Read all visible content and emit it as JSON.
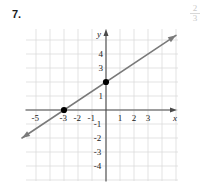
{
  "problem": {
    "number_label": "7."
  },
  "margin_note": {
    "numerator": "2",
    "denominator": "3"
  },
  "chart_data": {
    "type": "line",
    "title": "",
    "xlabel": "x",
    "ylabel": "y",
    "xlim": [
      -5.5,
      5.5
    ],
    "ylim": [
      -5.5,
      5.5
    ],
    "grid": true,
    "grid_step": 1,
    "legend": "none",
    "x_tick_labels": [
      "-5",
      "-3",
      "-2",
      "-1",
      "1",
      "2",
      "3"
    ],
    "x_tick_values": [
      -5,
      -3,
      -2,
      -1,
      1,
      2,
      3
    ],
    "y_tick_labels": [
      "4",
      "3",
      "1",
      "-1",
      "-2",
      "-3",
      "-4"
    ],
    "y_tick_values": [
      4,
      3,
      1,
      -1,
      -2,
      -3,
      -4
    ],
    "series": [
      {
        "name": "line",
        "equation": "y = (2/3)x + 2",
        "slope": 0.6666666667,
        "intercept": 2,
        "color": "#7a7a7a",
        "arrows": "both",
        "x": [
          -6,
          5
        ],
        "y": [
          -2,
          5.3333333
        ]
      }
    ],
    "points": [
      {
        "label": "x-intercept",
        "x": -3,
        "y": 0,
        "color": "#000000"
      },
      {
        "label": "y-intercept",
        "x": 0,
        "y": 2,
        "color": "#000000"
      }
    ],
    "colors": {
      "grid": "#dcdcdc",
      "axis": "#4a4a4a",
      "line": "#7a7a7a",
      "point": "#000000",
      "text": "#222222"
    }
  }
}
